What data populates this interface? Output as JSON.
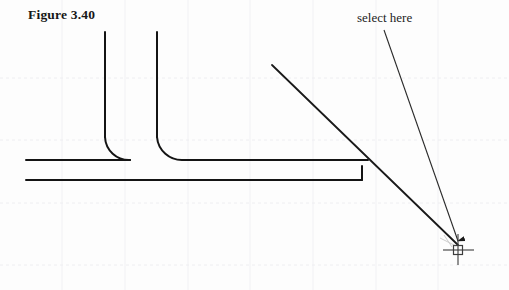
{
  "page": {
    "width": 509,
    "height": 290,
    "background_color": "#fdfdfd",
    "kind": "scanned-cad-figure"
  },
  "caption": {
    "text": "Figure 3.40"
  },
  "annotation": {
    "label_text": "select here",
    "leader": {
      "from_x": 384,
      "from_y": 30,
      "to_x": 458,
      "to_y": 243,
      "has_arrowhead": true,
      "arrow_direction": "down"
    }
  },
  "colors": {
    "line_color": "#141414",
    "annotation_color": "#2a2a2a",
    "grid_color": "#f0f0f2",
    "grid_color_faint": "#f5f5f7",
    "cursor_color": "#3c3c3c",
    "background": "#fdfdfd"
  },
  "drawing": {
    "description": "Two vertical lines joined by fillet arcs to a horizontal line, a lower horizontal line, and a diagonal cutting line crossing them at the right.",
    "entities": [
      {
        "name": "vertical-line-left",
        "type": "line",
        "x1": 105,
        "y1": 32,
        "x2": 105,
        "y2": 137
      },
      {
        "name": "vertical-line-right",
        "type": "line",
        "x1": 157,
        "y1": 32,
        "x2": 157,
        "y2": 137
      },
      {
        "name": "fillet-arc-left",
        "type": "arc",
        "from_x": 105,
        "from_y": 137,
        "to_x": 130,
        "to_y": 160,
        "radius": 24,
        "sweep": 0
      },
      {
        "name": "fillet-arc-right",
        "type": "arc",
        "from_x": 157,
        "from_y": 137,
        "to_x": 183,
        "to_y": 160,
        "radius": 25,
        "sweep": 1
      },
      {
        "name": "horizontal-line-upper-left",
        "type": "line",
        "x1": 26,
        "y1": 160,
        "x2": 130,
        "y2": 160
      },
      {
        "name": "horizontal-line-upper-right",
        "type": "line",
        "x1": 183,
        "y1": 160,
        "x2": 368,
        "y2": 160
      },
      {
        "name": "horizontal-line-lower",
        "type": "line",
        "x1": 26,
        "y1": 180,
        "x2": 362,
        "y2": 180
      },
      {
        "name": "right-edge-segment",
        "type": "line",
        "x1": 362,
        "y1": 180,
        "x2": 362,
        "y2": 166
      },
      {
        "name": "diagonal-cut-line",
        "type": "line",
        "x1": 272,
        "y1": 65,
        "x2": 458,
        "y2": 245
      }
    ]
  },
  "cursor": {
    "name": "crosshair-pickbox",
    "x": 458,
    "y": 248,
    "arm_length": 15,
    "pickbox_size": 9,
    "label": "AutoCAD crosshair with pickbox"
  },
  "grid": {
    "visible": true,
    "style": "faint dotted scan artifact",
    "vertical_lines_x": [
      62,
      125,
      188,
      250,
      313,
      376,
      438
    ],
    "horizontal_lines_y": [
      78,
      140,
      203,
      265
    ]
  }
}
